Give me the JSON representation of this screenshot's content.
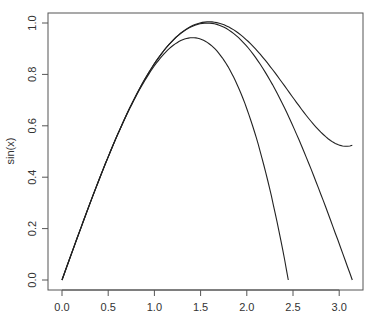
{
  "chart_data": {
    "type": "line",
    "title": "",
    "xlabel": "",
    "ylabel": "sin(x)",
    "xlim": [
      0,
      3.1416
    ],
    "ylim": [
      0,
      1.0
    ],
    "x_ticks": [
      "0.0",
      "0.5",
      "1.0",
      "1.5",
      "2.0",
      "2.5",
      "3.0"
    ],
    "y_ticks": [
      "0.0",
      "0.2",
      "0.4",
      "0.6",
      "0.8",
      "1.0"
    ],
    "grid": false,
    "legend": null,
    "series": [
      {
        "name": "sin(x)",
        "x": [
          0,
          0.5,
          1.0,
          1.5,
          1.5708,
          2.0,
          2.5,
          3.0,
          3.1416
        ],
        "values": [
          0,
          0.479,
          0.841,
          0.997,
          1.0,
          0.909,
          0.598,
          0.141,
          0.0
        ]
      },
      {
        "name": "x - x^3/6",
        "x": [
          0,
          0.5,
          1.0,
          1.414,
          2.0,
          2.449
        ],
        "values": [
          0,
          0.479,
          0.833,
          0.943,
          0.667,
          0.0
        ]
      },
      {
        "name": "x - x^3/6 + x^5/120",
        "x": [
          0,
          0.5,
          1.0,
          1.5,
          2.0,
          2.5,
          3.0,
          3.1416
        ],
        "values": [
          0,
          0.479,
          0.842,
          1.001,
          0.933,
          0.712,
          0.525,
          0.525
        ]
      }
    ]
  }
}
